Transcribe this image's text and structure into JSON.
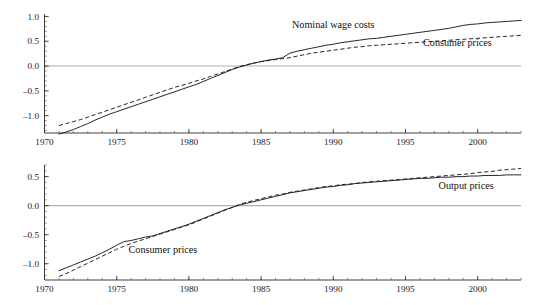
{
  "figure": {
    "title": "",
    "background": "#ffffff",
    "ink_color": "#1a1a1a",
    "zero_line_color": "#b0b0b0"
  },
  "chart_data": [
    {
      "type": "line",
      "panel": "top",
      "title": "",
      "xlabel": "",
      "ylabel": "",
      "xlim": [
        1970,
        2003
      ],
      "ylim": [
        -1.35,
        1.05
      ],
      "grid": false,
      "zero_line": true,
      "legend": "inline-annotations",
      "xticks": [
        1970,
        1975,
        1980,
        1985,
        1990,
        1995,
        2000
      ],
      "xtick_labels": [
        "1970",
        "1975",
        "1980",
        "1985",
        "1990",
        "1995",
        "2000"
      ],
      "xminor_tick_interval": 1,
      "yticks": [
        1.0,
        0.5,
        0.0,
        -0.5,
        -1.0
      ],
      "ytick_labels": [
        "1.0",
        "0.5",
        "0.0",
        "-0.5",
        "-1.0"
      ],
      "yminor_tick_interval": 0.1,
      "annotations": [
        {
          "text": "Nominal wage costs",
          "x": 1990.0,
          "y": 0.76
        },
        {
          "text": "Consumer prices",
          "x": 1998.6,
          "y": 0.4
        }
      ],
      "series": [
        {
          "name": "Nominal wage costs",
          "style": "solid",
          "x": [
            1971.0,
            1971.5,
            1972.0,
            1972.5,
            1973.0,
            1973.5,
            1974.0,
            1974.5,
            1975.0,
            1975.5,
            1976.0,
            1976.5,
            1977.0,
            1977.5,
            1978.0,
            1978.5,
            1979.0,
            1979.5,
            1980.0,
            1980.5,
            1981.0,
            1981.5,
            1982.0,
            1982.5,
            1983.0,
            1983.5,
            1984.0,
            1984.5,
            1985.0,
            1985.5,
            1986.0,
            1986.5,
            1987.0,
            1987.5,
            1988.0,
            1988.5,
            1989.0,
            1989.5,
            1990.0,
            1990.5,
            1991.0,
            1991.5,
            1992.0,
            1992.5,
            1993.0,
            1993.5,
            1994.0,
            1994.5,
            1995.0,
            1995.5,
            1996.0,
            1996.5,
            1997.0,
            1997.5,
            1998.0,
            1998.5,
            1999.0,
            1999.5,
            2000.0,
            2000.5,
            2001.0,
            2001.5,
            2002.0,
            2002.5,
            2003.0
          ],
          "y": [
            -1.37,
            -1.33,
            -1.28,
            -1.22,
            -1.16,
            -1.09,
            -1.03,
            -0.97,
            -0.92,
            -0.87,
            -0.82,
            -0.77,
            -0.72,
            -0.67,
            -0.62,
            -0.57,
            -0.52,
            -0.47,
            -0.42,
            -0.37,
            -0.31,
            -0.25,
            -0.19,
            -0.13,
            -0.07,
            -0.02,
            0.02,
            0.06,
            0.09,
            0.12,
            0.14,
            0.17,
            0.26,
            0.3,
            0.33,
            0.36,
            0.39,
            0.42,
            0.44,
            0.47,
            0.49,
            0.51,
            0.53,
            0.55,
            0.56,
            0.58,
            0.6,
            0.62,
            0.64,
            0.66,
            0.68,
            0.7,
            0.72,
            0.74,
            0.76,
            0.79,
            0.82,
            0.84,
            0.85,
            0.87,
            0.88,
            0.89,
            0.9,
            0.91,
            0.92
          ]
        },
        {
          "name": "Consumer prices",
          "style": "dashed",
          "x": [
            1971.0,
            1971.5,
            1972.0,
            1972.5,
            1973.0,
            1973.5,
            1974.0,
            1974.5,
            1975.0,
            1975.5,
            1976.0,
            1976.5,
            1977.0,
            1977.5,
            1978.0,
            1978.5,
            1979.0,
            1979.5,
            1980.0,
            1980.5,
            1981.0,
            1981.5,
            1982.0,
            1982.5,
            1983.0,
            1983.5,
            1984.0,
            1984.5,
            1985.0,
            1985.5,
            1986.0,
            1986.5,
            1987.0,
            1987.5,
            1988.0,
            1988.5,
            1989.0,
            1989.5,
            1990.0,
            1990.5,
            1991.0,
            1991.5,
            1992.0,
            1992.5,
            1993.0,
            1993.5,
            1994.0,
            1994.5,
            1995.0,
            1995.5,
            1996.0,
            1996.5,
            1997.0,
            1997.5,
            1998.0,
            1998.5,
            1999.0,
            1999.5,
            2000.0,
            2000.5,
            2001.0,
            2001.5,
            2002.0,
            2002.5,
            2003.0
          ],
          "y": [
            -1.2,
            -1.16,
            -1.12,
            -1.08,
            -1.03,
            -0.98,
            -0.93,
            -0.88,
            -0.83,
            -0.78,
            -0.73,
            -0.68,
            -0.63,
            -0.58,
            -0.53,
            -0.48,
            -0.43,
            -0.39,
            -0.35,
            -0.3,
            -0.26,
            -0.21,
            -0.16,
            -0.11,
            -0.06,
            -0.01,
            0.03,
            0.06,
            0.09,
            0.11,
            0.13,
            0.15,
            0.17,
            0.2,
            0.23,
            0.26,
            0.28,
            0.3,
            0.32,
            0.34,
            0.36,
            0.38,
            0.39,
            0.41,
            0.42,
            0.43,
            0.44,
            0.45,
            0.46,
            0.47,
            0.48,
            0.49,
            0.5,
            0.51,
            0.52,
            0.53,
            0.54,
            0.55,
            0.56,
            0.57,
            0.58,
            0.59,
            0.6,
            0.61,
            0.62
          ]
        }
      ]
    },
    {
      "type": "line",
      "panel": "bottom",
      "title": "",
      "xlabel": "",
      "ylabel": "",
      "xlim": [
        1970,
        2003
      ],
      "ylim": [
        -1.28,
        0.7
      ],
      "grid": false,
      "zero_line": true,
      "legend": "inline-annotations",
      "xticks": [
        1970,
        1975,
        1980,
        1985,
        1990,
        1995,
        2000
      ],
      "xtick_labels": [
        "1970",
        "1975",
        "1980",
        "1985",
        "1990",
        "1995",
        "2000"
      ],
      "xminor_tick_interval": 1,
      "yticks": [
        0.5,
        0.0,
        -0.5,
        -1.0
      ],
      "ytick_labels": [
        "0.5",
        "0.0",
        "-0.5",
        "-1.0"
      ],
      "yminor_tick_interval": 0.1,
      "annotations": [
        {
          "text": "Output prices",
          "x": 1999.2,
          "y": 0.29
        },
        {
          "text": "Consumer prices",
          "x": 1978.2,
          "y": -0.82
        }
      ],
      "series": [
        {
          "name": "Consumer prices",
          "style": "solid",
          "x": [
            1971.0,
            1971.5,
            1972.0,
            1972.5,
            1973.0,
            1973.5,
            1974.0,
            1974.5,
            1975.0,
            1975.5,
            1976.0,
            1976.5,
            1977.0,
            1977.5,
            1978.0,
            1978.5,
            1979.0,
            1979.5,
            1980.0,
            1980.5,
            1981.0,
            1981.5,
            1982.0,
            1982.5,
            1983.0,
            1983.5,
            1984.0,
            1984.5,
            1985.0,
            1985.5,
            1986.0,
            1986.5,
            1987.0,
            1987.5,
            1988.0,
            1988.5,
            1989.0,
            1989.5,
            1990.0,
            1990.5,
            1991.0,
            1991.5,
            1992.0,
            1992.5,
            1993.0,
            1993.5,
            1994.0,
            1994.5,
            1995.0,
            1995.5,
            1996.0,
            1996.5,
            1997.0,
            1997.5,
            1998.0,
            1998.5,
            1999.0,
            1999.5,
            2000.0,
            2000.5,
            2001.0,
            2001.5,
            2002.0,
            2002.5,
            2003.0
          ],
          "y": [
            -1.12,
            -1.07,
            -1.02,
            -0.97,
            -0.92,
            -0.87,
            -0.81,
            -0.75,
            -0.68,
            -0.62,
            -0.6,
            -0.57,
            -0.54,
            -0.52,
            -0.48,
            -0.44,
            -0.4,
            -0.36,
            -0.32,
            -0.27,
            -0.22,
            -0.17,
            -0.12,
            -0.07,
            -0.03,
            0.01,
            0.04,
            0.07,
            0.1,
            0.13,
            0.16,
            0.19,
            0.22,
            0.24,
            0.26,
            0.28,
            0.3,
            0.32,
            0.33,
            0.35,
            0.36,
            0.38,
            0.39,
            0.4,
            0.41,
            0.42,
            0.43,
            0.44,
            0.45,
            0.46,
            0.47,
            0.47,
            0.48,
            0.49,
            0.49,
            0.5,
            0.5,
            0.51,
            0.51,
            0.52,
            0.52,
            0.52,
            0.53,
            0.53,
            0.53
          ]
        },
        {
          "name": "Output prices",
          "style": "dashed",
          "x": [
            1971.0,
            1971.5,
            1972.0,
            1972.5,
            1973.0,
            1973.5,
            1974.0,
            1974.5,
            1975.0,
            1975.5,
            1976.0,
            1976.5,
            1977.0,
            1977.5,
            1978.0,
            1978.5,
            1979.0,
            1979.5,
            1980.0,
            1980.5,
            1981.0,
            1981.5,
            1982.0,
            1982.5,
            1983.0,
            1983.5,
            1984.0,
            1984.5,
            1985.0,
            1985.5,
            1986.0,
            1986.5,
            1987.0,
            1987.5,
            1988.0,
            1988.5,
            1989.0,
            1989.5,
            1990.0,
            1990.5,
            1991.0,
            1991.5,
            1992.0,
            1992.5,
            1993.0,
            1993.5,
            1994.0,
            1994.5,
            1995.0,
            1995.5,
            1996.0,
            1996.5,
            1997.0,
            1997.5,
            1998.0,
            1998.5,
            1999.0,
            1999.5,
            2000.0,
            2000.5,
            2001.0,
            2001.5,
            2002.0,
            2002.5,
            2003.0
          ],
          "y": [
            -1.22,
            -1.17,
            -1.11,
            -1.05,
            -0.99,
            -0.93,
            -0.87,
            -0.81,
            -0.75,
            -0.7,
            -0.65,
            -0.61,
            -0.57,
            -0.53,
            -0.49,
            -0.45,
            -0.41,
            -0.37,
            -0.33,
            -0.28,
            -0.23,
            -0.18,
            -0.13,
            -0.08,
            -0.03,
            0.02,
            0.06,
            0.09,
            0.12,
            0.15,
            0.18,
            0.2,
            0.23,
            0.25,
            0.27,
            0.29,
            0.31,
            0.33,
            0.34,
            0.36,
            0.37,
            0.38,
            0.4,
            0.41,
            0.42,
            0.43,
            0.44,
            0.45,
            0.46,
            0.47,
            0.48,
            0.49,
            0.5,
            0.51,
            0.52,
            0.53,
            0.54,
            0.55,
            0.57,
            0.58,
            0.59,
            0.61,
            0.62,
            0.63,
            0.64
          ]
        }
      ]
    }
  ]
}
